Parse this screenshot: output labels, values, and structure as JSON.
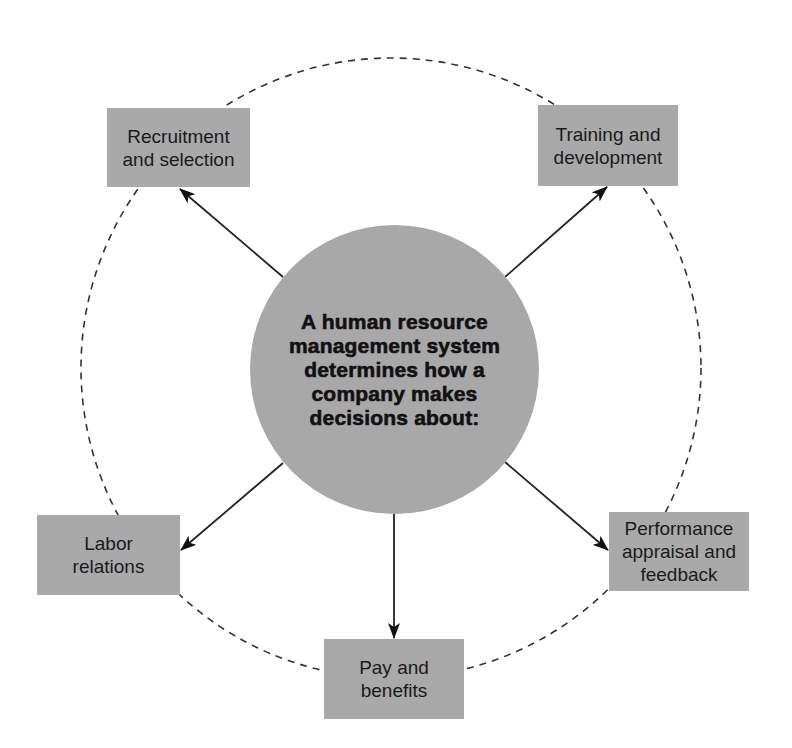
{
  "diagram": {
    "center": {
      "lines": [
        "A human resource",
        "management system",
        "determines how a",
        "company makes",
        "decisions about:"
      ]
    },
    "nodes": [
      {
        "id": "recruitment",
        "lines": [
          "Recruitment",
          "and selection"
        ]
      },
      {
        "id": "training",
        "lines": [
          "Training and",
          "development"
        ]
      },
      {
        "id": "labor",
        "lines": [
          "Labor",
          "relations"
        ]
      },
      {
        "id": "performance",
        "lines": [
          "Performance",
          "appraisal and",
          "feedback"
        ]
      },
      {
        "id": "pay",
        "lines": [
          "Pay and",
          "benefits"
        ]
      }
    ],
    "colors": {
      "box_fill": "#a9a9a9",
      "center_fill": "#a8a8a8",
      "line": "#222222",
      "dashed_circle": "#333333"
    }
  }
}
